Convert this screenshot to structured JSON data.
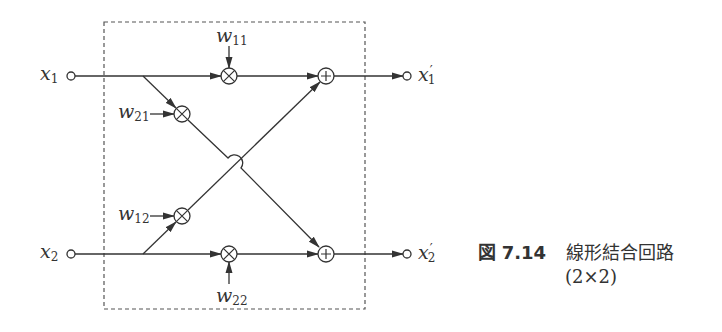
{
  "figure": {
    "caption_prefix": "図",
    "caption_number": "7.14",
    "caption_title": "線形結合回路",
    "caption_subtitle": "(2×2)"
  },
  "inputs": [
    {
      "var": "x",
      "sub": "1"
    },
    {
      "var": "x",
      "sub": "2"
    }
  ],
  "outputs": [
    {
      "var": "x",
      "prime": "′",
      "sub": "1"
    },
    {
      "var": "x",
      "prime": "′",
      "sub": "2"
    }
  ],
  "weights": [
    {
      "var": "w",
      "sub": "11"
    },
    {
      "var": "w",
      "sub": "21"
    },
    {
      "var": "w",
      "sub": "12"
    },
    {
      "var": "w",
      "sub": "22"
    }
  ],
  "symbols": {
    "multiplier": "⊗",
    "adder": "⊕"
  },
  "colors": {
    "line": "#333333",
    "background": "#ffffff"
  }
}
